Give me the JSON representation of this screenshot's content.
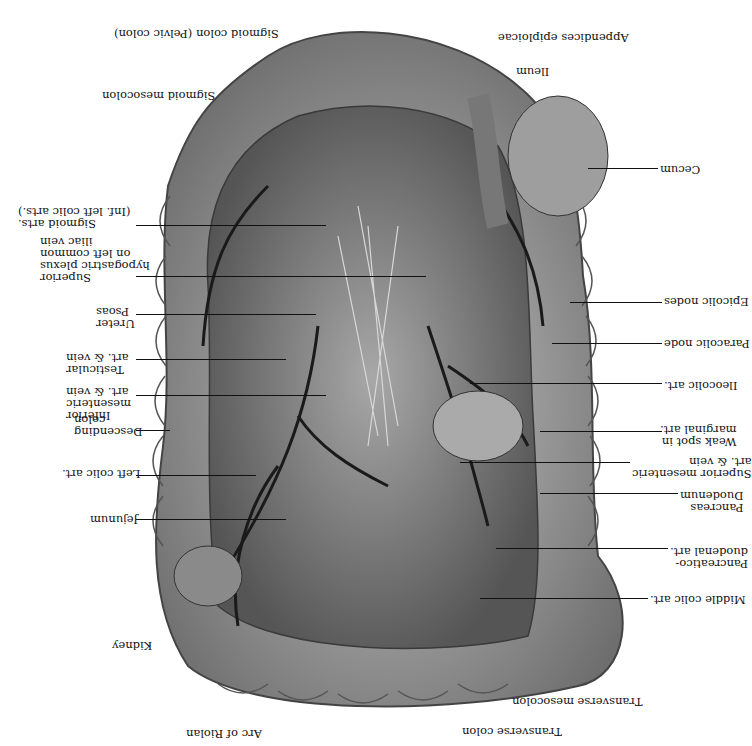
{
  "figure": {
    "orientation": "rotated 180 degrees",
    "signature": "Ta(signature)"
  },
  "labels_right_side": [
    {
      "id": "appendices-epiploicae",
      "text": "Appendices epiploicae"
    },
    {
      "id": "ileum",
      "text": "Ileum"
    },
    {
      "id": "cecum",
      "text": "Cecum"
    },
    {
      "id": "epicolic-nodes",
      "text": "Epicolic nodes"
    },
    {
      "id": "paracolic-node",
      "text": "Paracolic node"
    },
    {
      "id": "ileocolic-art",
      "text": "Ileocolic art."
    },
    {
      "id": "weak-spot",
      "text": "Weak spot in\nmarginal art."
    },
    {
      "id": "superior-mesenteric",
      "text": "Superior mesenteric\nart. & vein"
    },
    {
      "id": "pancreas-duodenum",
      "text": "Pancreas\nDuodenum"
    },
    {
      "id": "pancreaticoduodenal-art",
      "text": "Pancreatico-\nduodenal art."
    },
    {
      "id": "middle-colic-art",
      "text": "Middle colic art."
    },
    {
      "id": "transverse-mesocolon",
      "text": "Transverse mesocolon"
    },
    {
      "id": "transverse-colon",
      "text": "Transverse colon"
    }
  ],
  "labels_left_side": [
    {
      "id": "sigmoid-colon",
      "text": "Sigmoid colon (Pelvic colon)"
    },
    {
      "id": "sigmoid-mesocolon",
      "text": "Sigmoid mesocolon"
    },
    {
      "id": "sigmoid-arts",
      "text": "Sigmoid arts.\n(Inf. left colic arts.)"
    },
    {
      "id": "superior-hypogastric-plexus",
      "text": "Superior\nhypogastric plexus\non left common\niliac vein"
    },
    {
      "id": "ureter-psoas",
      "text": "Ureter\nPsoas"
    },
    {
      "id": "testicular",
      "text": "Testicular\nart. & vein"
    },
    {
      "id": "inferior-mesenteric",
      "text": "Inferior\nmesenteric\nart. & vein"
    },
    {
      "id": "descending-colon",
      "text": "Descending\ncolon"
    },
    {
      "id": "left-colic-art",
      "text": "Left colic art."
    },
    {
      "id": "jejunum",
      "text": "Jejunum"
    },
    {
      "id": "kidney",
      "text": "Kidney"
    },
    {
      "id": "arc-of-riolan",
      "text": "Arc of Riolan"
    }
  ],
  "colors": {
    "background": "#ffffff",
    "ink": "#111111",
    "tissue_light": "#bdbdbd",
    "tissue_mid": "#8e8e8e",
    "tissue_dark": "#5a5a5a",
    "vessel": "#1a1a1a"
  }
}
